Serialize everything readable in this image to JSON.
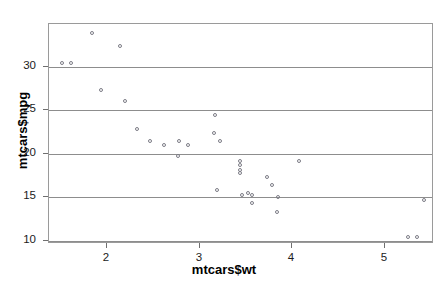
{
  "figure": {
    "width": 448,
    "height": 289,
    "background": "#ffffff",
    "frame_color": "#9a9a9a",
    "grid_color": "#8d8d8d",
    "point_color": "#7c7c86"
  },
  "chart_data": {
    "type": "scatter",
    "title": "",
    "xlabel": "mtcars$wt",
    "ylabel": "mtcars$mpg",
    "xlim": [
      1.375,
      5.53
    ],
    "ylim": [
      9.6,
      34.9
    ],
    "xticks": [
      2,
      3,
      4,
      5
    ],
    "xtick_labels": [
      "2",
      "3",
      "4",
      "5"
    ],
    "yticks": [
      10,
      15,
      20,
      25,
      30
    ],
    "ytick_labels": [
      "10",
      "15",
      "20",
      "25",
      "30"
    ],
    "grid": "horizontal",
    "grid_values": [
      10,
      15,
      20,
      25,
      30
    ],
    "legend": null,
    "marker": "open-circle",
    "n_points": 32,
    "x": [
      1.513,
      1.615,
      1.835,
      1.935,
      2.14,
      2.2,
      2.32,
      2.465,
      2.62,
      2.77,
      2.78,
      2.875,
      3.15,
      3.17,
      3.19,
      3.215,
      3.435,
      3.44,
      3.44,
      3.44,
      3.46,
      3.52,
      3.57,
      3.57,
      3.73,
      3.78,
      3.84,
      3.845,
      4.07,
      5.25,
      5.345,
      5.424
    ],
    "y": [
      30.4,
      30.4,
      33.9,
      27.3,
      32.4,
      26,
      22.8,
      21.5,
      21,
      19.7,
      21.4,
      21,
      22.4,
      24.4,
      15.8,
      21.4,
      19.2,
      17.8,
      18.7,
      18.1,
      15.2,
      15.5,
      15.2,
      14.3,
      17.3,
      16.4,
      13.3,
      15,
      19.2,
      10.4,
      10.4,
      14.7
    ]
  }
}
